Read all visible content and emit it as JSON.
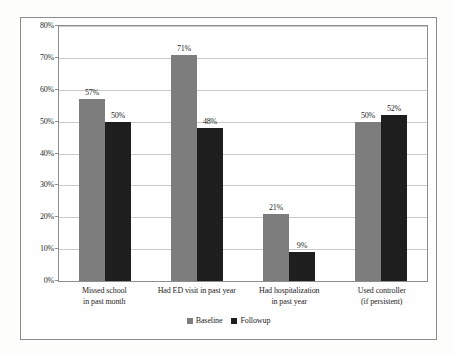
{
  "chart_data": {
    "type": "bar",
    "title": "",
    "xlabel": "",
    "ylabel": "",
    "ylim": [
      0,
      80
    ],
    "grid": true,
    "legend_position": "bottom-center",
    "ytick_labels": [
      "80%",
      "70%",
      "60%",
      "50%",
      "40%",
      "30%",
      "20%",
      "10%",
      "0%"
    ],
    "ytick_values": [
      80,
      70,
      60,
      50,
      40,
      30,
      20,
      10,
      0
    ],
    "categories": [
      "Missed school\nin past  month",
      "Had ED visit in past year",
      "Had hospitalization\nin past year",
      "Used controller\n(if persistent)"
    ],
    "category_lines": [
      [
        "Missed school",
        "in past  month"
      ],
      [
        "Had ED visit in past year",
        ""
      ],
      [
        "Had hospitalization",
        "in past year"
      ],
      [
        "Used controller",
        "(if persistent)"
      ]
    ],
    "series": [
      {
        "name": "Baseline",
        "color": "#7d7d7d",
        "values": [
          57,
          71,
          21,
          50
        ],
        "labels": [
          "57%",
          "71%",
          "21%",
          "50%"
        ]
      },
      {
        "name": "Followup",
        "color": "#1e1e1e",
        "values": [
          50,
          48,
          9,
          52
        ],
        "labels": [
          "50%",
          "48%",
          "9%",
          "52%"
        ]
      }
    ]
  },
  "legend": {
    "items": [
      {
        "label": "Baseline",
        "color": "#7d7d7d"
      },
      {
        "label": "Followup",
        "color": "#1e1e1e"
      }
    ]
  }
}
